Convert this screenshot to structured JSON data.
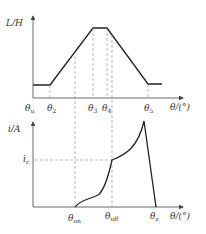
{
  "upper_plot": {
    "y_axis_label": "L/H",
    "x_axis_label": "θ/(°)",
    "ticks": [
      {
        "base": "θ",
        "sub": "u"
      },
      {
        "base": "θ",
        "sub": "2"
      },
      {
        "base": "θ",
        "sub": "3"
      },
      {
        "base": "θ",
        "sub": "4"
      },
      {
        "base": "θ",
        "sub": "5"
      }
    ]
  },
  "lower_plot": {
    "y_axis_label": "i/A",
    "x_axis_label": "θ/(°)",
    "y_mark": {
      "base": "i",
      "sub": "c"
    },
    "ticks": [
      {
        "base": "θ",
        "sub": "on"
      },
      {
        "base": "θ",
        "sub": "off"
      },
      {
        "base": "θ",
        "sub": "z"
      }
    ]
  },
  "colors": {
    "line": "#222222",
    "axis": "#444444",
    "dashed": "#888888"
  }
}
